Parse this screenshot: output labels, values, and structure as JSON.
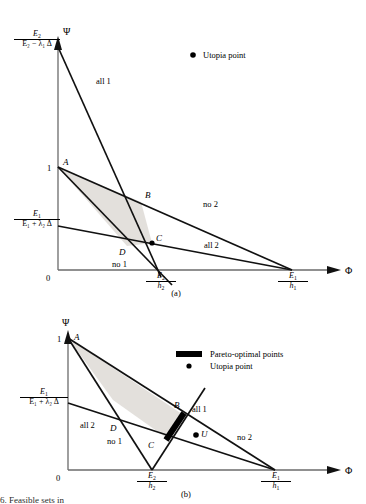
{
  "figure": {
    "title_clipped": "6. Feasible sets in",
    "axes": {
      "x_name": "Φ",
      "y_name": "Ψ",
      "origin_label": "0",
      "unit_label": "1"
    }
  },
  "panel_a": {
    "caption": "(a)",
    "y_axis_top_label": {
      "num_E": "E",
      "num_sub": "2",
      "den": "E₂ − λ₁ Δ"
    },
    "y_axis_mid_label": {
      "num_E": "E",
      "num_sub": "1",
      "den": "E₁ + λ₂ Δ"
    },
    "y_tick_one": "1",
    "origin": "0",
    "x_tick_1": {
      "num": "E",
      "num_sub": "2",
      "den": "h",
      "den_sub": "2"
    },
    "x_tick_2": {
      "num": "E",
      "num_sub": "1",
      "den": "h",
      "den_sub": "1"
    },
    "region_labels": [
      {
        "name": "all-1",
        "text": "all 1"
      },
      {
        "name": "no-2",
        "text": "no 2"
      },
      {
        "name": "all-2",
        "text": "all 2"
      },
      {
        "name": "no-1",
        "text": "no 1"
      }
    ],
    "points": [
      {
        "id": "A",
        "label": "A"
      },
      {
        "id": "B",
        "label": "B"
      },
      {
        "id": "C",
        "label": "C"
      },
      {
        "id": "D",
        "label": "D"
      }
    ],
    "legend": [
      {
        "marker": "dot",
        "text": "Utopia point"
      }
    ]
  },
  "panel_b": {
    "caption": "(b)",
    "y_axis_mid_label": {
      "num_E": "E",
      "num_sub": "1",
      "den": "E₁ + λ₂ Δ"
    },
    "y_tick_one": "1",
    "origin": "0",
    "x_tick_1": {
      "num": "E",
      "num_sub": "2",
      "den": "h",
      "den_sub": "2"
    },
    "x_tick_2": {
      "num": "E",
      "num_sub": "1",
      "den": "h",
      "den_sub": "1"
    },
    "region_labels": [
      {
        "name": "all-1",
        "text": "all 1"
      },
      {
        "name": "no-2",
        "text": "no 2"
      },
      {
        "name": "all-2",
        "text": "all 2"
      },
      {
        "name": "no-1",
        "text": "no 1"
      }
    ],
    "points": [
      {
        "id": "A",
        "label": "A"
      },
      {
        "id": "B",
        "label": "B"
      },
      {
        "id": "C",
        "label": "C"
      },
      {
        "id": "D",
        "label": "D"
      },
      {
        "id": "U",
        "label": "U"
      }
    ],
    "legend": [
      {
        "marker": "bar",
        "text": "Pareto-optimal points"
      },
      {
        "marker": "dot",
        "text": "Utopia point"
      }
    ]
  },
  "colors": {
    "line": "#111111",
    "axis": "#555555",
    "shade": "#e3e0dc",
    "pareto": "#000000",
    "background": "#ffffff"
  }
}
